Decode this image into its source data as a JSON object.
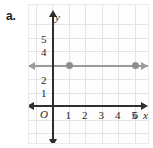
{
  "problem": {
    "letter": "a."
  },
  "graph": {
    "origin_label": "O",
    "x_axis_name": "x",
    "y_axis_name": "y",
    "x_tick_labels": [
      "1",
      "2",
      "3",
      "4",
      "5",
      "6"
    ],
    "y_tick_labels": [
      "1",
      "2",
      "4",
      "5"
    ],
    "line_color": "#9a9a9a",
    "axis_color": "#2e2e2e",
    "grid_color": "#e4e2e2"
  },
  "chart_data": {
    "type": "line",
    "title": "",
    "xlabel": "x",
    "ylabel": "y",
    "xlim": [
      -1,
      7
    ],
    "ylim": [
      -1,
      6
    ],
    "grid": true,
    "legend": "none",
    "x_ticks": [
      1,
      2,
      3,
      4,
      5,
      6
    ],
    "y_ticks": [
      1,
      2,
      3,
      4,
      5
    ],
    "y_ticks_visible": [
      1,
      2,
      4,
      5
    ],
    "series": [
      {
        "name": "y = 3",
        "type": "line",
        "equation": "y = 3",
        "color": "#9a9a9a",
        "arrows": "both",
        "x": [
          -1,
          7
        ],
        "y": [
          3,
          3
        ],
        "points": [
          {
            "x": 2,
            "y": 3
          },
          {
            "x": 6,
            "y": 3
          }
        ]
      }
    ],
    "annotations": []
  }
}
